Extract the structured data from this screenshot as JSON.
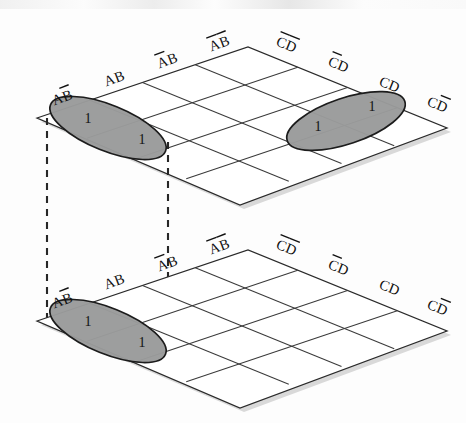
{
  "figure": {
    "background_color": "#fdfdfd",
    "ink_color": "#1c1c1c",
    "group_fill_color": "#9a9b9b",
    "shadow_color": "#d9d9d9",
    "map_count": 2,
    "grid_rows": 4,
    "grid_cols": 4
  },
  "maps": [
    {
      "id": "upper-map",
      "position": "top",
      "row_axis_labels": [
        "AB̅",
        "AB",
        "A̅B",
        "A̅B̅"
      ],
      "col_axis_labels": [
        "C̅D̅",
        "C̅D",
        "CD",
        "CD̅"
      ],
      "cells": [
        {
          "row": 0,
          "col": 0,
          "value": "1",
          "grouped": true
        },
        {
          "row": 1,
          "col": 0,
          "value": "1",
          "grouped": true
        },
        {
          "row": 0,
          "col": 2,
          "value": "1",
          "grouped": true
        },
        {
          "row": 0,
          "col": 3,
          "value": "1",
          "grouped": true
        }
      ],
      "groups": [
        {
          "id": "upper-group-left",
          "cells": [
            [
              0,
              0
            ],
            [
              1,
              0
            ]
          ],
          "orientation": "along-ab-axis",
          "value": "1"
        },
        {
          "id": "upper-group-right",
          "cells": [
            [
              0,
              2
            ],
            [
              0,
              3
            ]
          ],
          "orientation": "along-cd-axis",
          "value": "1"
        }
      ]
    },
    {
      "id": "lower-map",
      "position": "bottom",
      "row_axis_labels": [
        "AB̅",
        "AB",
        "A̅B",
        "A̅B̅"
      ],
      "col_axis_labels": [
        "C̅D̅",
        "C̅D",
        "CD",
        "CD̅"
      ],
      "cells": [
        {
          "row": 0,
          "col": 0,
          "value": "1",
          "grouped": true
        },
        {
          "row": 1,
          "col": 0,
          "value": "1",
          "grouped": true
        }
      ],
      "groups": [
        {
          "id": "lower-group-left",
          "cells": [
            [
              0,
              0
            ],
            [
              1,
              0
            ]
          ],
          "orientation": "along-ab-axis",
          "value": "1"
        }
      ]
    }
  ],
  "connectors": [
    {
      "id": "connector-left",
      "style": "dashed",
      "from_map": "upper-map",
      "to_map": "lower-map"
    },
    {
      "id": "connector-right",
      "style": "dashed",
      "from_map": "upper-map",
      "to_map": "lower-map"
    }
  ],
  "labels": {
    "upper": {
      "ab": [
        "AB̅",
        "AB",
        "A̅B",
        "A̅B̅"
      ],
      "cd": [
        "C̅D̅",
        "C̅D",
        "CD",
        "CD̅"
      ]
    },
    "lower": {
      "ab": [
        "AB̅",
        "AB",
        "A̅B",
        "A̅B̅"
      ],
      "cd": [
        "C̅D̅",
        "C̅D",
        "CD",
        "CD̅"
      ]
    }
  },
  "values": {
    "one": "1"
  }
}
